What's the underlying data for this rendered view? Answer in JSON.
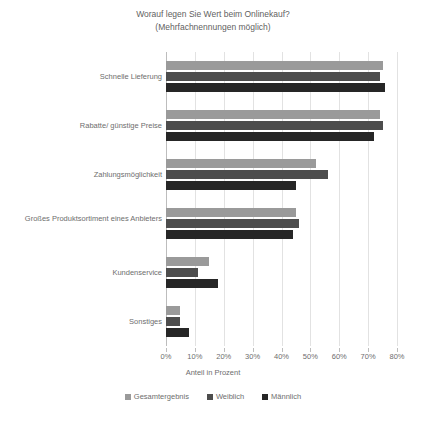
{
  "chart": {
    "title": "Worauf legen Sie Wert beim Onlinekauf?",
    "subtitle": "(Mehrfachnennungen möglich)",
    "xlabel": "Anteil in Prozent"
  },
  "chart_data": {
    "type": "bar",
    "orientation": "horizontal",
    "title": "Worauf legen Sie Wert beim Onlinekauf? (Mehrfachnennungen möglich)",
    "xlabel": "Anteil in Prozent",
    "ylabel": "",
    "xlim": [
      0,
      80
    ],
    "xticks": [
      "0%",
      "10%",
      "20%",
      "30%",
      "40%",
      "50%",
      "60%",
      "70%",
      "80%"
    ],
    "xtick_values": [
      0,
      10,
      20,
      30,
      40,
      50,
      60,
      70,
      80
    ],
    "grid": true,
    "legend_position": "bottom",
    "categories": [
      "Schnelle Lieferung",
      "Rabatte/ günstige Preise",
      "Zahlungsmöglichkeit",
      "Großes Produktsortiment eines Anbieters",
      "Kundenservice",
      "Sonstiges"
    ],
    "series": [
      {
        "name": "Gesamtergebnis",
        "color": "#9a9a9a",
        "values": [
          75,
          74,
          52,
          45,
          15,
          5
        ]
      },
      {
        "name": "Weiblich",
        "color": "#4d4d4d",
        "values": [
          74,
          75,
          56,
          46,
          11,
          5
        ]
      },
      {
        "name": "Männlich",
        "color": "#262626",
        "values": [
          76,
          72,
          45,
          44,
          18,
          8
        ]
      }
    ]
  }
}
